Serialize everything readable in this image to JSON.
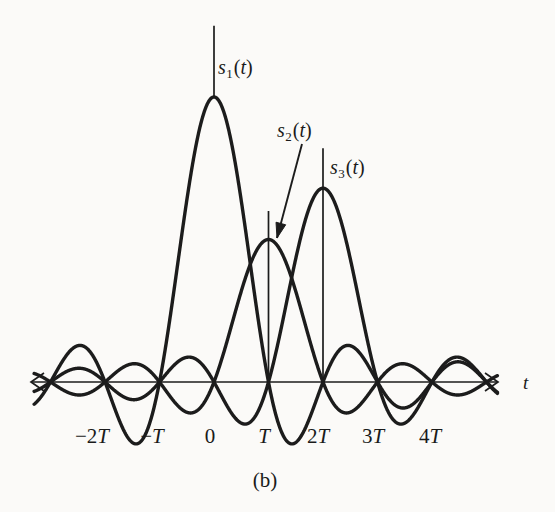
{
  "figure": {
    "panel_label": "(b)",
    "axis_label": "t",
    "background_color": "#fbfaf8",
    "ink_color": "#1c1c1c"
  },
  "signal_labels": [
    {
      "name": "s1",
      "symbol": "s",
      "subscript": "1",
      "argument": "(t)",
      "text": "s1(t)",
      "x": 218,
      "y": 56
    },
    {
      "name": "s2",
      "symbol": "s",
      "subscript": "2",
      "argument": "(t)",
      "text": "s2(t)",
      "x": 277,
      "y": 119
    },
    {
      "name": "s3",
      "symbol": "s",
      "subscript": "3",
      "argument": "(t)",
      "text": "s3(t)",
      "x": 330,
      "y": 156
    }
  ],
  "tick_labels": [
    {
      "text": "-2T",
      "neg": "−",
      "num": "2",
      "unit": "T",
      "x": 92,
      "y": 424
    },
    {
      "text": "-T",
      "neg": "−",
      "num": "",
      "unit": "T",
      "x": 152,
      "y": 424
    },
    {
      "text": "0",
      "neg": "",
      "num": "0",
      "unit": "",
      "x": 210,
      "y": 424
    },
    {
      "text": "T",
      "neg": "",
      "num": "",
      "unit": "T",
      "x": 264,
      "y": 424
    },
    {
      "text": "2T",
      "neg": "",
      "num": "2",
      "unit": "T",
      "x": 318,
      "y": 424
    },
    {
      "text": "3T",
      "neg": "",
      "num": "3",
      "unit": "T",
      "x": 373,
      "y": 424
    },
    {
      "text": "4T",
      "neg": "",
      "num": "4",
      "unit": "T",
      "x": 430,
      "y": 424
    }
  ],
  "chart_data": {
    "type": "line",
    "title": "",
    "subtitle": "(b)",
    "xlabel": "t",
    "ylabel": "",
    "grid": false,
    "legend": "inline-annotations",
    "x_tick_values": [
      -2,
      -1,
      0,
      1,
      2,
      3,
      4
    ],
    "x_tick_labels": [
      "-2T",
      "-T",
      "0",
      "T",
      "2T",
      "3T",
      "4T"
    ],
    "xlim": [
      -3.3,
      5.2
    ],
    "ylim": [
      -0.25,
      1.08
    ],
    "x_unit": "T",
    "series": [
      {
        "name": "s1(t)",
        "formula": "A1 * sinc((t - 0T)/T)",
        "amplitude": 1.0,
        "peak_x": 0,
        "peak_y": 1.0,
        "zeros_x": [
          -3,
          -2,
          -1,
          1,
          2,
          3,
          4,
          5
        ],
        "label_position": {
          "x": 218,
          "y": 56
        },
        "marker_line": {
          "x": 0,
          "y_top": 1.25,
          "y_bottom": 1.0
        }
      },
      {
        "name": "s2(t)",
        "formula": "A2 * sinc((t - 1T)/T)",
        "amplitude": 0.5,
        "peak_x": 1,
        "peak_y": 0.5,
        "zeros_x": [
          -3,
          -2,
          -1,
          0,
          2,
          3,
          4,
          5
        ],
        "label_position": {
          "x": 277,
          "y": 119
        },
        "marker_line": {
          "x": 1,
          "y_top": 0.6,
          "y_bottom": 0.0
        },
        "pointer": {
          "from_x": 302,
          "from_y": 144,
          "to_x": 277,
          "to_y": 238
        }
      },
      {
        "name": "s3(t)",
        "formula": "A3 * sinc((t - 2T)/T)",
        "amplitude": 0.68,
        "peak_x": 2,
        "peak_y": 0.68,
        "zeros_x": [
          -3,
          -2,
          -1,
          0,
          1,
          3,
          4,
          5
        ],
        "label_position": {
          "x": 330,
          "y": 156
        },
        "marker_line": {
          "x": 2,
          "y_top": 0.82,
          "y_bottom": 0.0
        }
      }
    ]
  },
  "geometry": {
    "axis_y_px": 382,
    "origin_x_px": 214,
    "period_px": 54.5,
    "unit_amplitude_px": 285,
    "axis_x_start_px": 31,
    "axis_x_end_px": 498
  }
}
